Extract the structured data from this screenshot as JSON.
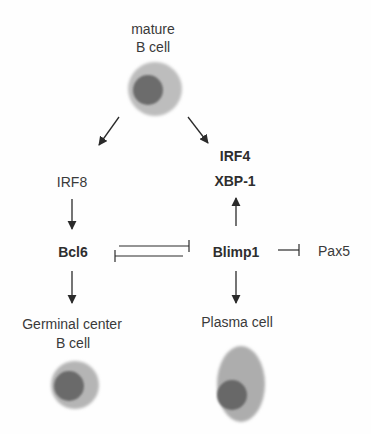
{
  "diagram": {
    "nodes": {
      "mature_b_cell": {
        "line1": "mature",
        "line2": "B cell"
      },
      "irf8": {
        "label": "IRF8"
      },
      "irf4": {
        "label": "IRF4"
      },
      "xbp1": {
        "label": "XBP-1"
      },
      "bcl6": {
        "label": "Bcl6"
      },
      "blimp1": {
        "label": "Blimp1"
      },
      "pax5": {
        "label": "Pax5"
      },
      "germinal_center": {
        "line1": "Germinal center",
        "line2": "B cell"
      },
      "plasma_cell": {
        "label": "Plasma cell"
      }
    },
    "edges": [
      {
        "from": "mature B cell",
        "to": "IRF8",
        "type": "activation"
      },
      {
        "from": "mature B cell",
        "to": "IRF4/XBP-1",
        "type": "activation"
      },
      {
        "from": "IRF8",
        "to": "Bcl6",
        "type": "activation"
      },
      {
        "from": "Blimp1",
        "to": "IRF4/XBP-1",
        "type": "activation"
      },
      {
        "from": "Bcl6",
        "to": "Blimp1",
        "type": "inhibition"
      },
      {
        "from": "Blimp1",
        "to": "Bcl6",
        "type": "inhibition"
      },
      {
        "from": "Blimp1",
        "to": "Pax5",
        "type": "inhibition"
      },
      {
        "from": "Bcl6",
        "to": "Germinal center B cell",
        "type": "activation"
      },
      {
        "from": "Blimp1",
        "to": "Plasma cell",
        "type": "activation"
      }
    ],
    "colors": {
      "cytoplasm": "#b8b8b8",
      "nucleus": "#6e6e6e",
      "line": "#2a2a2a",
      "text": "#3a3a3a"
    }
  }
}
